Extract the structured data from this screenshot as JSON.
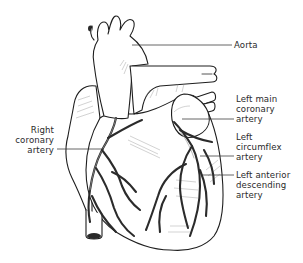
{
  "diagram": {
    "labels": {
      "aorta": [
        "Aorta"
      ],
      "left_main_coronary_artery": [
        "Left main",
        "coronary",
        "artery"
      ],
      "right_coronary_artery": [
        "Right",
        "coronary",
        "artery"
      ],
      "left_circumflex_artery": [
        "Left",
        "circumflex",
        "artery"
      ],
      "left_anterior_descending_artery": [
        "Left anterior",
        "descending",
        "artery"
      ]
    },
    "colors": {
      "background": "#ffffff",
      "outline": "#1e1e1e",
      "label_text": "#2a2a2a",
      "leader_line": "#333333"
    }
  }
}
